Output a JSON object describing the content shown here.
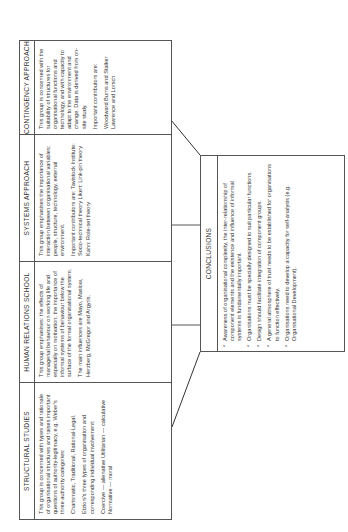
{
  "columns": [
    {
      "title": "STRUCTURAL STUDIES",
      "paragraphs": [
        "This group is concerned with types and rationale of organisational structures and raises important questions of authority-legitimacy, e.g. Weber's three authority categories:",
        "Charismatic, Traditional, Rational-Legal.",
        "Etzioni's three types of organisation and corresponding individual involvement:",
        "Coercive — alienative Utilitarian — calculative Normative — moral"
      ]
    },
    {
      "title": "HUMAN RELATIONS SCHOOL",
      "paragraphs": [
        "This group emphasises: the effects of managerial behaviour on working life and especially on motivation; the importance of informal systems of behaviour below the surface of the formal organisational system.",
        "The main influences are Mayo, Maslow, Herzberg, McGregor and Argyris."
      ]
    },
    {
      "title": "SYSTEMS APPROACH",
      "paragraphs": [
        "This group emphasises the importance of interaction between organisational variables: people, structure, technology, external environment.",
        "Important contributors are: Tavistock Institute: Socio-technical theory Likert: Link-pin theory Kahn: Role-set theory"
      ]
    },
    {
      "title": "CONTINGENCY APPROACH",
      "paragraphs": [
        "This group is concerned with the suitability of structures for organisational functions and technology, and with capacity to adapt to the environment and change. Data is derived from on-site study.",
        "Important contributors are:",
        "Woodward Burns and Stalker Lawrence and Lorsch"
      ]
    }
  ],
  "conclusions": {
    "title": "CONCLUSIONS",
    "items": [
      "Awareness of organisational complexity, the inter-relationship of component elements and the existence and influence of informal systems is fundamentally important.",
      "Organisations must be specially designed to suit particular functions.",
      "Design should facilitate integration of component groups.",
      "A general atmosphere of trust needs to be established for organisations to function effectively.",
      "Organisations need to develop a capacity for self-analysis (e.g. Organisational Development)."
    ]
  }
}
